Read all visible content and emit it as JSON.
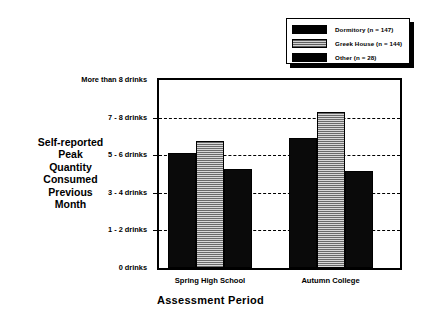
{
  "chart_data": {
    "type": "bar",
    "title": "",
    "xlabel": "Assessment  Period",
    "ylabel": "Self-reported\nPeak\nQuantity\nConsumed\nPrevious\nMonth",
    "categories": [
      "Spring High School",
      "Autumn College"
    ],
    "ytick_labels": [
      "More than 8 drinks",
      "7 - 8 drinks",
      "5 - 6 drinks",
      "3 - 4 drinks",
      "1 - 2 drinks",
      "0 drinks"
    ],
    "ytick_values": [
      5,
      4,
      3,
      2,
      1,
      0
    ],
    "ylim": [
      0,
      5
    ],
    "grid": true,
    "legend_position": "top-right",
    "series": [
      {
        "name": "Dormitory",
        "n": 147,
        "legend_label": "Dormitory  (n = 147)",
        "fill": "solid-black",
        "values": [
          3.05,
          3.45
        ]
      },
      {
        "name": "Greek House",
        "n": 144,
        "legend_label": "Greek House  (n = 144)",
        "fill": "gray-hatched",
        "values": [
          3.38,
          4.15
        ]
      },
      {
        "name": "Other",
        "n": 28,
        "legend_label": "Other  (n = 28)",
        "fill": "solid-black",
        "values": [
          2.63,
          2.57
        ]
      }
    ]
  },
  "y_axis": {
    "title_lines": [
      "Self-reported",
      "Peak",
      "Quantity",
      "Consumed",
      "Previous",
      "Month"
    ],
    "title_text": "Self-reported Peak Quantity Consumed Previous Month"
  },
  "x_axis": {
    "title": "Assessment  Period",
    "tick_labels": [
      "Spring High School",
      "Autumn College"
    ]
  },
  "legend": {
    "items": [
      {
        "label": "Dormitory  (n = 147)",
        "swatch": "solid-black"
      },
      {
        "label": "Greek House  (n = 144)",
        "swatch": "gray-hatched"
      },
      {
        "label": "Other  (n = 28)",
        "swatch": "solid-black"
      }
    ]
  },
  "colors": {
    "bar_dark": "#0a0a0a",
    "bar_hatch_line": "#6a6a6a",
    "bar_hatch_bg": "#d8d8d8",
    "axis": "#000000",
    "background": "#ffffff"
  }
}
